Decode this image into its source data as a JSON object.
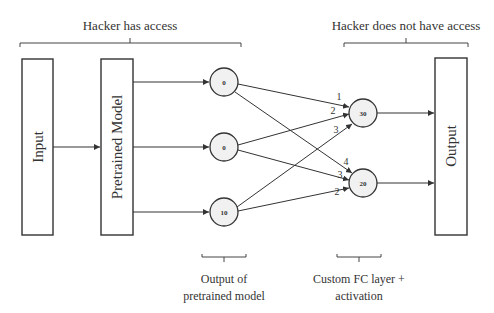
{
  "top_labels": {
    "left": "Hacker has access",
    "right": "Hacker does not have access"
  },
  "blocks": {
    "input": "Input",
    "pretrained": "Pretrained Model",
    "output": "Output"
  },
  "hidden_nodes": [
    {
      "value": "0"
    },
    {
      "value": "0"
    },
    {
      "value": "10"
    }
  ],
  "fc_nodes": [
    {
      "value": "30"
    },
    {
      "value": "20"
    }
  ],
  "weights": {
    "to_30": [
      "1",
      "2",
      "3"
    ],
    "to_20": [
      "4",
      "3",
      "2"
    ]
  },
  "bottom_labels": {
    "pretrained_output_line1": "Output of",
    "pretrained_output_line2": "pretrained model",
    "fc_line1": "Custom FC layer +",
    "fc_line2": "activation"
  }
}
